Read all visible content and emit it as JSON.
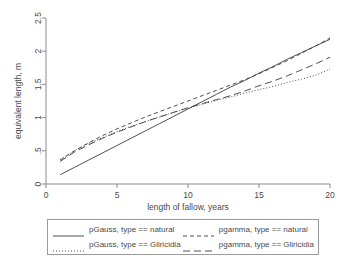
{
  "chart_data": {
    "type": "line",
    "title": "",
    "xlabel": "length of fallow, years",
    "ylabel": "equivalent length, m",
    "xlim": [
      0,
      20
    ],
    "ylim": [
      0,
      2.5
    ],
    "xticks": [
      0,
      5,
      10,
      15,
      20
    ],
    "xtick_labels": [
      "0",
      "5",
      "10",
      "15",
      "20"
    ],
    "yticks": [
      0,
      0.5,
      1,
      1.5,
      2,
      2.5
    ],
    "ytick_labels": [
      "0",
      ".5",
      "1",
      "1.5",
      "2",
      "2.5"
    ],
    "grid": false,
    "legend_position": "bottom",
    "x": [
      1,
      2,
      3,
      4,
      5,
      6,
      7,
      8,
      9,
      10,
      11,
      12,
      13,
      14,
      15,
      16,
      17,
      18,
      19,
      20
    ],
    "series": [
      {
        "name": "pGauss, type == natural",
        "style": "solid",
        "color": "#3c3c3c",
        "values": [
          0.14,
          0.25,
          0.36,
          0.47,
          0.58,
          0.69,
          0.8,
          0.91,
          1.02,
          1.13,
          1.24,
          1.35,
          1.46,
          1.56,
          1.67,
          1.77,
          1.88,
          1.98,
          2.08,
          2.18
        ]
      },
      {
        "name": "pGauss, type == Gliricidia",
        "style": "dotted",
        "color": "#3c3c3c",
        "values": [
          0.37,
          0.5,
          0.61,
          0.7,
          0.79,
          0.87,
          0.94,
          1.01,
          1.08,
          1.14,
          1.2,
          1.26,
          1.31,
          1.37,
          1.42,
          1.47,
          1.53,
          1.58,
          1.64,
          1.73
        ]
      },
      {
        "name": "pgamma, type == natural",
        "style": "short-dash",
        "color": "#3c3c3c",
        "values": [
          0.36,
          0.5,
          0.62,
          0.73,
          0.83,
          0.92,
          1.01,
          1.09,
          1.17,
          1.25,
          1.33,
          1.41,
          1.49,
          1.57,
          1.66,
          1.76,
          1.86,
          1.97,
          2.08,
          2.2
        ]
      },
      {
        "name": "pgamma, type == Gliricidia",
        "style": "long-dash",
        "color": "#3c3c3c",
        "values": [
          0.34,
          0.48,
          0.59,
          0.69,
          0.78,
          0.86,
          0.94,
          1.01,
          1.08,
          1.15,
          1.21,
          1.27,
          1.33,
          1.4,
          1.48,
          1.55,
          1.63,
          1.72,
          1.81,
          1.91
        ]
      }
    ]
  },
  "legend": {
    "entries": [
      {
        "label": "pGauss, type == natural",
        "style": "solid"
      },
      {
        "label": "pgamma, type == natural",
        "style": "short-dash"
      },
      {
        "label": "pGauss, type == Gliricidia",
        "style": "dotted"
      },
      {
        "label": "pgamma, type == Gliricidia",
        "style": "long-dash"
      }
    ]
  }
}
